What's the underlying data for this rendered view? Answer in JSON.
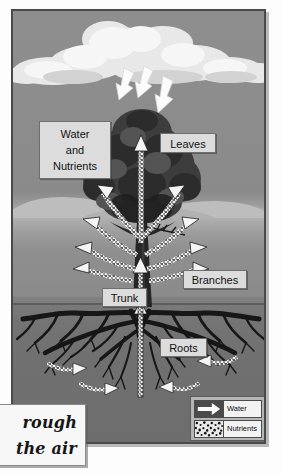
{
  "figure": {
    "kind": "science-diagram"
  },
  "labels": {
    "water_and_nutrients": "Water\nand\nNutrients",
    "water_and_nutrients_lines": [
      "Water",
      "and",
      "Nutrients"
    ],
    "leaves": "Leaves",
    "branches": "Branches",
    "trunk": "Trunk",
    "roots": "Roots"
  },
  "legend": {
    "title": "",
    "items": [
      {
        "label": "Water",
        "swatch": "white-arrow-icon"
      },
      {
        "label": "Nutrients",
        "swatch": "speckled-dots-pattern"
      }
    ]
  },
  "annotation": {
    "lines": [
      "rough",
      "the air"
    ],
    "note_style": "handwritten"
  },
  "scene": {
    "cloud_count": 1,
    "rain_arrow_count": 3,
    "sky_color": "#8d8d8d",
    "cloud_color": "#e9e9e9",
    "ground_color": "#737373",
    "root_color": "#1a1a1a",
    "canopy_color": "#3b3b3b",
    "label_box_color": "#dcdcdc",
    "border_color": "#4a4a4a"
  }
}
